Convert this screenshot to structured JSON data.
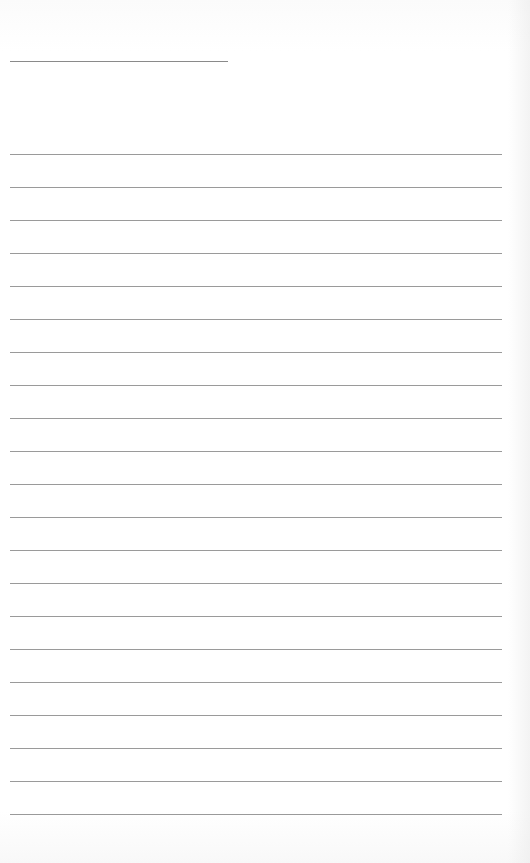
{
  "document": {
    "type": "lined-writing-sheet",
    "title_field": {
      "value": "",
      "line_color": "#8a8a8a"
    },
    "line_color": "#9a9a9a",
    "background_color": "#ffffff",
    "line_count": 21,
    "first_line_y": 154,
    "line_spacing_px": 33,
    "lines": [
      "",
      "",
      "",
      "",
      "",
      "",
      "",
      "",
      "",
      "",
      "",
      "",
      "",
      "",
      "",
      "",
      "",
      "",
      "",
      "",
      ""
    ]
  }
}
